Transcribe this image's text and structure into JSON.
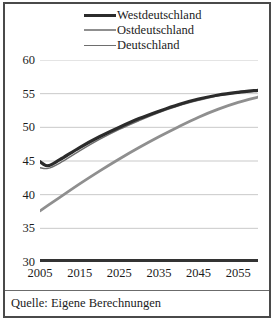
{
  "legend": {
    "position": "top-center",
    "entries": [
      {
        "label": "Westdeutschland",
        "color": "#2b2b2b",
        "width": 3.2,
        "icon": "line-swatch-dark"
      },
      {
        "label": "Ostdeutschland",
        "color": "#8f8f8f",
        "width": 2.8,
        "icon": "line-swatch-gray"
      },
      {
        "label": "Deutschland",
        "color": "#6e6e6e",
        "width": 1.4,
        "icon": "line-swatch-thin"
      }
    ]
  },
  "axes": {
    "ylabel": "",
    "xlabel": "",
    "ylim": [
      30,
      60
    ],
    "yticks": [
      60,
      55,
      50,
      45,
      40,
      35,
      30
    ],
    "xlim": [
      2005,
      2060
    ],
    "xticks": [
      2005,
      2015,
      2025,
      2035,
      2045,
      2055
    ],
    "grid": "horizontal",
    "grid_color": "#c9c9c9",
    "baseline_color": "#333333"
  },
  "source": {
    "text": "Quelle: Eigene Berechnungen"
  },
  "chart_data": {
    "type": "line",
    "title": "",
    "subtitle": "",
    "xlabel": "",
    "ylabel": "",
    "xlim": [
      2005,
      2060
    ],
    "ylim": [
      30,
      60
    ],
    "grid": "horizontal gridlines only",
    "legend_position": "top-center",
    "xticks": [
      2005,
      2015,
      2025,
      2035,
      2045,
      2055
    ],
    "yticks": [
      30,
      35,
      40,
      45,
      50,
      55,
      60
    ],
    "x": [
      2005,
      2007,
      2010,
      2015,
      2020,
      2025,
      2030,
      2035,
      2040,
      2045,
      2050,
      2055,
      2060
    ],
    "series": [
      {
        "name": "Westdeutschland",
        "color": "#2b2b2b",
        "values": [
          44.9,
          44.3,
          45.2,
          47.0,
          48.6,
          50.0,
          51.3,
          52.4,
          53.4,
          54.2,
          54.8,
          55.2,
          55.5
        ]
      },
      {
        "name": "Ostdeutschland",
        "color": "#8f8f8f",
        "values": [
          37.6,
          38.4,
          39.6,
          41.6,
          43.5,
          45.3,
          47.0,
          48.6,
          50.1,
          51.5,
          52.7,
          53.7,
          54.5
        ]
      },
      {
        "name": "Deutschland",
        "color": "#6e6e6e",
        "values": [
          44.0,
          43.9,
          44.7,
          46.5,
          48.2,
          49.7,
          51.0,
          52.2,
          53.2,
          54.0,
          54.7,
          55.1,
          55.4
        ]
      }
    ],
    "annotations": [
      "Quelle: Eigene Berechnungen"
    ]
  }
}
